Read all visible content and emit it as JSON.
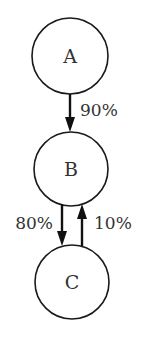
{
  "diagram": {
    "type": "state-transition",
    "nodes": [
      {
        "id": "A",
        "label": "A",
        "cx": 70,
        "cy": 56,
        "r": 38
      },
      {
        "id": "B",
        "label": "B",
        "cx": 71,
        "cy": 169,
        "r": 37
      },
      {
        "id": "C",
        "label": "C",
        "cx": 72,
        "cy": 282,
        "r": 37
      }
    ],
    "edges": [
      {
        "from": "A",
        "to": "B",
        "label": "90%"
      },
      {
        "from": "B",
        "to": "C",
        "label": "80%"
      },
      {
        "from": "C",
        "to": "B",
        "label": "10%"
      }
    ],
    "colors": {
      "stroke": "#1a1a1a",
      "text": "#333333",
      "background": "#ffffff"
    }
  }
}
